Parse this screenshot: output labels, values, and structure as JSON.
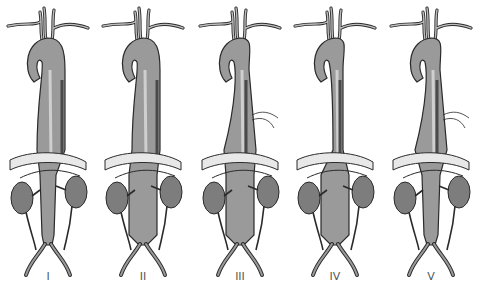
{
  "figure": {
    "panels": [
      {
        "label": "I",
        "extent": "thoracic",
        "cx": 48
      },
      {
        "label": "II",
        "extent": "thoracic-abdominal",
        "cx": 143
      },
      {
        "label": "III",
        "extent": "mid-thoracic-abdominal",
        "cx": 240
      },
      {
        "label": "IV",
        "extent": "abdominal",
        "cx": 335
      },
      {
        "label": "V",
        "extent": "mid-thoracic-suprarenal",
        "cx": 431
      }
    ]
  },
  "colors": {
    "aorta_fill": "#9a9a9a",
    "aorta_highlight": "#cfcfcf",
    "aorta_shadow": "#4a4a4a",
    "outline": "#2a2a2a",
    "kidney_fill": "#7d7d7d",
    "diaphragm": "#e8e8e8"
  }
}
